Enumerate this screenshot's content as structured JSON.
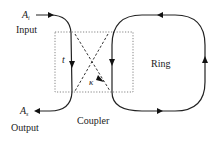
{
  "diagram": {
    "type": "ring-resonator-coupler",
    "labels": {
      "input_field": "A",
      "input_field_sub": "i",
      "input": "Input",
      "output_field": "A",
      "output_field_sub": "s",
      "output": "Output",
      "transmission": "t",
      "coupling": "κ",
      "ring": "Ring",
      "coupler": "Coupler"
    },
    "colors": {
      "line": "#222222",
      "box": "#777777",
      "background": "#ffffff"
    },
    "arrows": {
      "input": "right",
      "bus_in_coupler": "down",
      "output": "left",
      "ring_left": "down",
      "ring_top": "left",
      "ring_right": "up",
      "ring_bottom": "right",
      "cross_coupling": "down-right"
    }
  }
}
